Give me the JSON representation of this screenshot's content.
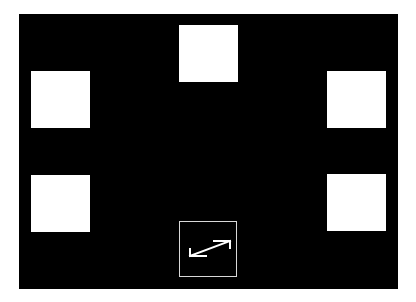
{
  "stage": {
    "background": "#000000"
  },
  "tiles": [
    {
      "name": "top-center",
      "color": "#ffffff"
    },
    {
      "name": "middle-left",
      "color": "#ffffff"
    },
    {
      "name": "middle-right",
      "color": "#ffffff"
    },
    {
      "name": "bottom-left",
      "color": "#ffffff"
    },
    {
      "name": "bottom-right",
      "color": "#ffffff"
    }
  ],
  "controls": {
    "expand_icon": "diagonal-double-arrow-icon",
    "icon_color": "#ffffff",
    "border_color": "#d8d8d8"
  }
}
